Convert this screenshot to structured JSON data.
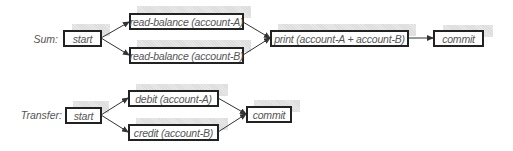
{
  "diagram": {
    "type": "flow",
    "colors": {
      "border": "#222222",
      "text": "#555555",
      "shadow": "#e0e0e0",
      "edge": "#333333"
    },
    "rows": [
      {
        "label": "Sum:",
        "nodes": {
          "start": "start",
          "read_a": "read-balance (account-A)",
          "read_b": "read-balance (account-B)",
          "print": "print (account-A + account-B)",
          "commit": "commit"
        },
        "edges": [
          [
            "start",
            "read_a"
          ],
          [
            "start",
            "read_b"
          ],
          [
            "read_a",
            "print"
          ],
          [
            "read_b",
            "print"
          ],
          [
            "print",
            "commit"
          ]
        ]
      },
      {
        "label": "Transfer:",
        "nodes": {
          "start": "start",
          "debit": "debit (account-A)",
          "credit": "credit (account-B)",
          "commit": "commit"
        },
        "edges": [
          [
            "start",
            "debit"
          ],
          [
            "start",
            "credit"
          ],
          [
            "debit",
            "commit"
          ],
          [
            "credit",
            "commit"
          ]
        ]
      }
    ]
  }
}
